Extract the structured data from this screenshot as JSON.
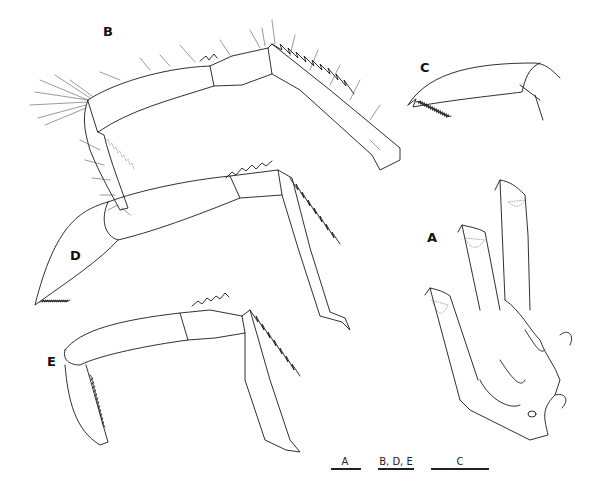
{
  "figure": {
    "panels": [
      {
        "id": "B",
        "label": "B",
        "description": "appendage with setae, dactylus with denticles"
      },
      {
        "id": "C",
        "label": "C",
        "description": "dactylus detail, serrated ventral margin"
      },
      {
        "id": "D",
        "label": "D",
        "description": "appendage, dactylus folded"
      },
      {
        "id": "E",
        "label": "E",
        "description": "appendage, dactylus with serrations"
      },
      {
        "id": "A",
        "label": "A",
        "description": "three coxal/basal segments with stippled areas"
      }
    ],
    "scale_bars": [
      {
        "label": "A",
        "length_px": 30
      },
      {
        "label": "B, D, E",
        "length_px": 36
      },
      {
        "label": "C",
        "length_px": 58
      }
    ],
    "colors": {
      "line": "#1a1a1a",
      "background": "#ffffff"
    }
  }
}
